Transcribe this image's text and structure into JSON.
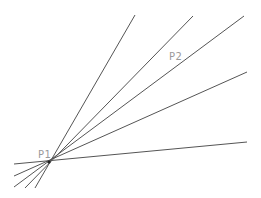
{
  "diagram": {
    "type": "line-pencil",
    "line_color": "#555555",
    "label_color": "#9a9a9a",
    "points": [
      {
        "id": "p1",
        "label": "P1",
        "x": 49,
        "y": 162,
        "label_x": 38,
        "label_y": 150
      },
      {
        "id": "p2",
        "label": "P2",
        "x": 175,
        "y": 60,
        "label_x": 169,
        "label_y": 52
      }
    ],
    "lines": [
      {
        "x1": 35,
        "y1": 188,
        "x2": 135,
        "y2": 15
      },
      {
        "x1": 25,
        "y1": 188,
        "x2": 193,
        "y2": 16
      },
      {
        "x1": 14,
        "y1": 187,
        "x2": 244,
        "y2": 16
      },
      {
        "x1": 14,
        "y1": 176,
        "x2": 247,
        "y2": 72
      },
      {
        "x1": 14,
        "y1": 164,
        "x2": 247,
        "y2": 142
      }
    ]
  }
}
